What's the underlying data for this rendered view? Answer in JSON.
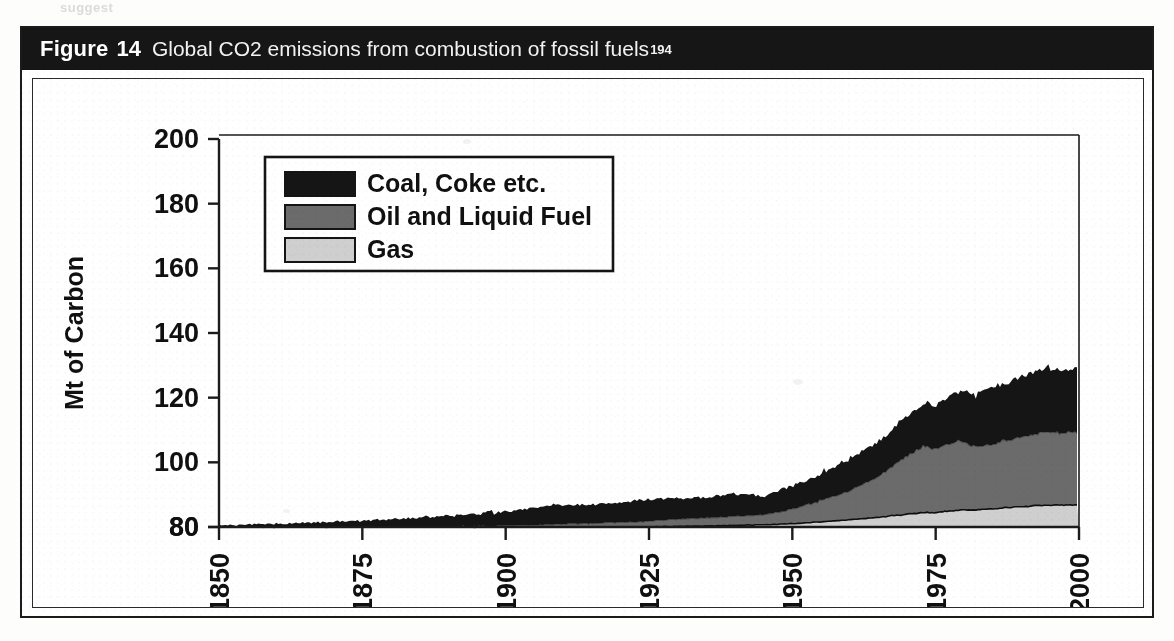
{
  "page": {
    "top_remnant_text": "suggest"
  },
  "figure": {
    "caption_label": "Figure",
    "caption_number": "14",
    "caption_text": "Global CO2 emissions from combustion of fossil fuels",
    "caption_superscript": "194"
  },
  "legend": {
    "position": "top-left-inside",
    "items": [
      {
        "label": "Coal, Coke etc.",
        "color": "#151515"
      },
      {
        "label": "Oil and Liquid Fuel",
        "color": "#6b6b6b"
      },
      {
        "label": "Gas",
        "color": "#cfcfcf"
      }
    ]
  },
  "colors": {
    "coal": "#151515",
    "oil": "#6b6b6b",
    "gas": "#cfcfcf",
    "axis": "#1b1b1b",
    "caption_bar": "#161616",
    "panel_background": "#ffffff"
  },
  "chart_data": {
    "type": "area",
    "stacked": true,
    "title": "Global CO2 emissions from combustion of fossil fuels",
    "xlabel": "",
    "ylabel": "Mt of Carbon",
    "xlim": [
      1850,
      2000
    ],
    "ylim": [
      80,
      200
    ],
    "grid": false,
    "legend_position": "top-left",
    "xticks": [
      "1850",
      "1875",
      "1900",
      "1925",
      "1950",
      "1975",
      "2000"
    ],
    "xtick_values": [
      1850,
      1875,
      1900,
      1925,
      1950,
      1975,
      2000
    ],
    "yticks": [
      "80",
      "80",
      "100",
      "120",
      "140",
      "160",
      "180",
      "200"
    ],
    "ytick_values": [
      80,
      80,
      100,
      120,
      140,
      160,
      180,
      200
    ],
    "ytick_note": "Bottom two tick labels both read 80 in the scanned original",
    "x": [
      1850,
      1855,
      1860,
      1865,
      1870,
      1875,
      1880,
      1885,
      1890,
      1895,
      1900,
      1905,
      1910,
      1915,
      1920,
      1925,
      1930,
      1935,
      1940,
      1945,
      1950,
      1955,
      1960,
      1965,
      1970,
      1973,
      1975,
      1979,
      1982,
      1985,
      1990,
      1994
    ],
    "series": [
      {
        "name": "Gas",
        "values": [
          0,
          0,
          0,
          0,
          0,
          0,
          0,
          0,
          0,
          0,
          0,
          0,
          0,
          0,
          0,
          0,
          0.2,
          0.3,
          0.5,
          0.7,
          1.0,
          1.6,
          2.2,
          3.0,
          4.0,
          4.5,
          4.5,
          5.2,
          5.3,
          5.6,
          6.3,
          6.8
        ]
      },
      {
        "name": "Oil and Liquid Fuel",
        "values": [
          0,
          0,
          0,
          0,
          0,
          0,
          0,
          0.1,
          0.2,
          0.3,
          0.4,
          0.6,
          0.9,
          1.1,
          1.4,
          1.8,
          2.2,
          2.5,
          2.8,
          3.0,
          4.5,
          6.5,
          9.0,
          12.5,
          18.0,
          20.5,
          19.5,
          21.5,
          19.5,
          20.0,
          21.5,
          22.5
        ]
      },
      {
        "name": "Coal, Coke etc.",
        "values": [
          0.6,
          0.8,
          1.0,
          1.3,
          1.6,
          2.0,
          2.4,
          2.8,
          3.3,
          3.8,
          4.4,
          5.2,
          6.0,
          5.8,
          6.2,
          6.8,
          6.5,
          6.3,
          7.0,
          6.0,
          7.2,
          8.5,
          10.0,
          11.0,
          12.5,
          13.5,
          13.8,
          15.5,
          16.5,
          17.5,
          19.0,
          19.5
        ]
      }
    ],
    "total_peak_value": 188,
    "total_peak_year": 1994
  }
}
